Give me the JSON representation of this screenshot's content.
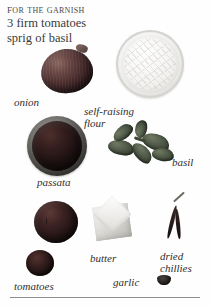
{
  "page": {
    "background_color": "#fefefe",
    "text_color": "#2f2f2f",
    "rule_color": "#8e8e8e"
  },
  "heading": {
    "title": "For the garnish",
    "lines": [
      "3 firm tomatoes",
      "sprig of basil"
    ]
  },
  "ingredients": [
    {
      "id": "onion",
      "caption": "onion"
    },
    {
      "id": "self-raising-flour",
      "caption": "self-raising\nflour"
    },
    {
      "id": "passata",
      "caption": "passata"
    },
    {
      "id": "basil",
      "caption": "basil"
    },
    {
      "id": "tomatoes",
      "caption": "tomatoes"
    },
    {
      "id": "butter",
      "caption": "butter"
    },
    {
      "id": "garlic",
      "caption": "garlic"
    },
    {
      "id": "dried-chillies",
      "caption": "dried\nchillies"
    }
  ]
}
